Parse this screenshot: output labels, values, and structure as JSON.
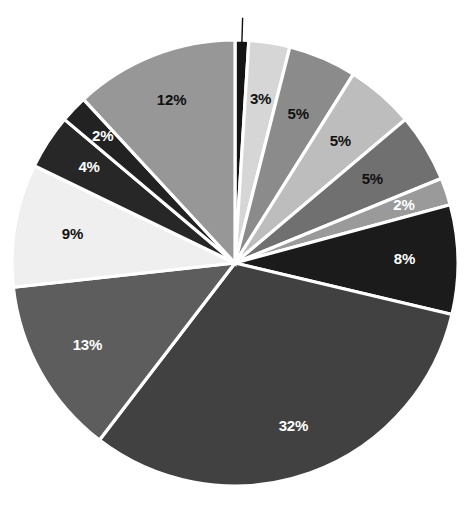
{
  "chart_data": {
    "type": "pie",
    "title": "",
    "subtitle": "",
    "xlabel": "",
    "ylabel": "",
    "legend_position": "none",
    "grid": false,
    "value_suffix": "%",
    "start_angle_deg": 0,
    "direction": "clockwise",
    "total_labeled": 101,
    "categories": [
      "Slice 1",
      "Slice 2",
      "Slice 3",
      "Slice 4",
      "Slice 5",
      "Slice 6",
      "Slice 7",
      "Slice 8",
      "Slice 9",
      "Slice 10",
      "Slice 11",
      "Slice 12",
      "Slice 13"
    ],
    "values": [
      1,
      3,
      5,
      5,
      5,
      2,
      8,
      32,
      13,
      9,
      4,
      2,
      12
    ],
    "labels": [
      "1%",
      "3%",
      "5%",
      "5%",
      "5%",
      "2%",
      "8%",
      "32%",
      "13%",
      "9%",
      "4%",
      "2%",
      "12%"
    ],
    "colors": [
      "#141414",
      "#d6d6d6",
      "#8b8b8b",
      "#bdbdbd",
      "#707070",
      "#9a9a9a",
      "#1b1b1b",
      "#414141",
      "#5d5d5d",
      "#efefef",
      "#272727",
      "#222222",
      "#979797"
    ],
    "label_colors": [
      "#101010",
      "#101010",
      "#101010",
      "#101010",
      "#101010",
      "#ffffff",
      "#ffffff",
      "#ffffff",
      "#ffffff",
      "#101010",
      "#ffffff",
      "#ffffff",
      "#101010"
    ],
    "label_radius_factor": [
      1.22,
      0.74,
      0.72,
      0.72,
      0.72,
      0.8,
      0.76,
      0.78,
      0.76,
      0.74,
      0.78,
      0.82,
      0.78
    ],
    "separator_color": "#ffffff",
    "background_color": "#ffffff",
    "geometry": {
      "center_x": 235,
      "center_y": 263,
      "radius": 223
    }
  }
}
